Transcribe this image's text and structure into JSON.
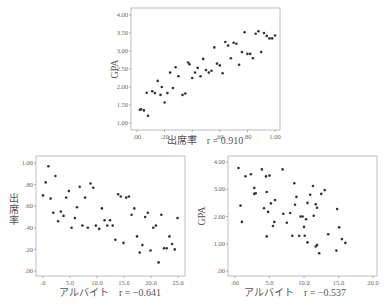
{
  "chart_data": [
    {
      "id": "top",
      "type": "scatter",
      "title": "",
      "xlabel": "出席率",
      "ylabel": "GPA",
      "annotation": "r = 0.910",
      "xlim": [
        0,
        1.0
      ],
      "ylim": [
        1.0,
        4.0
      ],
      "xticks": [
        ".00",
        ".20",
        ".40",
        ".60",
        ".80",
        "1.00"
      ],
      "yticks": [
        "1.00",
        "1.50",
        "2.00",
        "2.50",
        "3.00",
        "3.50",
        "4.00"
      ],
      "grid": false,
      "points": [
        [
          0.02,
          1.37
        ],
        [
          0.03,
          1.38
        ],
        [
          0.05,
          1.35
        ],
        [
          0.07,
          1.84
        ],
        [
          0.08,
          1.2
        ],
        [
          0.11,
          1.88
        ],
        [
          0.13,
          1.83
        ],
        [
          0.15,
          2.17
        ],
        [
          0.17,
          1.78
        ],
        [
          0.18,
          2.0
        ],
        [
          0.2,
          1.57
        ],
        [
          0.22,
          1.83
        ],
        [
          0.24,
          2.4
        ],
        [
          0.26,
          1.97
        ],
        [
          0.28,
          2.55
        ],
        [
          0.3,
          2.3
        ],
        [
          0.33,
          1.78
        ],
        [
          0.35,
          1.82
        ],
        [
          0.37,
          2.68
        ],
        [
          0.38,
          2.63
        ],
        [
          0.4,
          2.25
        ],
        [
          0.42,
          2.4
        ],
        [
          0.44,
          2.53
        ],
        [
          0.46,
          2.3
        ],
        [
          0.48,
          2.78
        ],
        [
          0.5,
          2.47
        ],
        [
          0.52,
          2.4
        ],
        [
          0.54,
          2.45
        ],
        [
          0.56,
          3.1
        ],
        [
          0.58,
          2.65
        ],
        [
          0.6,
          2.6
        ],
        [
          0.62,
          2.38
        ],
        [
          0.64,
          3.25
        ],
        [
          0.66,
          3.15
        ],
        [
          0.68,
          2.8
        ],
        [
          0.7,
          3.23
        ],
        [
          0.72,
          3.2
        ],
        [
          0.74,
          2.62
        ],
        [
          0.76,
          2.97
        ],
        [
          0.78,
          3.52
        ],
        [
          0.8,
          2.92
        ],
        [
          0.82,
          2.92
        ],
        [
          0.84,
          2.8
        ],
        [
          0.86,
          3.48
        ],
        [
          0.88,
          3.55
        ],
        [
          0.9,
          2.97
        ],
        [
          0.92,
          3.5
        ],
        [
          0.94,
          3.42
        ],
        [
          0.96,
          3.35
        ],
        [
          0.98,
          3.35
        ],
        [
          1.0,
          3.43
        ]
      ]
    },
    {
      "id": "bottom_left",
      "type": "scatter",
      "title": "",
      "xlabel": "アルバイト",
      "ylabel": "出席率",
      "annotation": "r = −0.641",
      "xlim": [
        0,
        25.0
      ],
      "ylim": [
        0,
        1.0
      ],
      "xticks": [
        ".0",
        "5.0",
        "10.0",
        "15.0",
        "20.0",
        "25.0"
      ],
      "yticks": [
        ".00",
        ".20",
        ".40",
        ".60",
        ".80",
        "1.00"
      ],
      "grid": false,
      "points": [
        [
          0.0,
          0.7
        ],
        [
          0.5,
          0.82
        ],
        [
          1.0,
          0.97
        ],
        [
          1.4,
          0.67
        ],
        [
          1.9,
          0.54
        ],
        [
          2.3,
          0.88
        ],
        [
          2.8,
          0.46
        ],
        [
          3.3,
          0.55
        ],
        [
          3.8,
          0.51
        ],
        [
          4.3,
          0.68
        ],
        [
          4.8,
          0.74
        ],
        [
          5.3,
          0.4
        ],
        [
          5.9,
          0.49
        ],
        [
          6.3,
          0.59
        ],
        [
          6.8,
          0.78
        ],
        [
          7.3,
          0.42
        ],
        [
          7.8,
          0.68
        ],
        [
          8.3,
          0.4
        ],
        [
          8.8,
          0.81
        ],
        [
          9.3,
          0.77
        ],
        [
          9.8,
          0.42
        ],
        [
          10.4,
          0.39
        ],
        [
          10.9,
          0.58
        ],
        [
          11.4,
          0.47
        ],
        [
          11.9,
          0.42
        ],
        [
          12.4,
          0.47
        ],
        [
          12.9,
          0.42
        ],
        [
          13.4,
          0.29
        ],
        [
          13.9,
          0.71
        ],
        [
          14.4,
          0.69
        ],
        [
          14.9,
          0.26
        ],
        [
          15.4,
          0.68
        ],
        [
          15.9,
          0.69
        ],
        [
          16.4,
          0.52
        ],
        [
          16.9,
          0.58
        ],
        [
          17.4,
          0.32
        ],
        [
          17.9,
          0.17
        ],
        [
          18.4,
          0.24
        ],
        [
          18.9,
          0.5
        ],
        [
          19.4,
          0.54
        ],
        [
          19.9,
          0.19
        ],
        [
          20.4,
          0.4
        ],
        [
          20.9,
          0.42
        ],
        [
          21.4,
          0.08
        ],
        [
          21.9,
          0.52
        ],
        [
          22.4,
          0.21
        ],
        [
          22.9,
          0.21
        ],
        [
          23.4,
          0.32
        ],
        [
          23.9,
          0.25
        ],
        [
          24.4,
          0.2
        ],
        [
          24.9,
          0.49
        ]
      ]
    },
    {
      "id": "bottom_right",
      "type": "scatter",
      "title": "",
      "xlabel": "アルバイト",
      "ylabel": "GPA",
      "annotation": "r = −0.537",
      "xlim": [
        0,
        20.0
      ],
      "ylim": [
        0,
        4.0
      ],
      "xticks": [
        ".00",
        "5.0",
        "10.0",
        "15.0",
        "20.0"
      ],
      "yticks": [
        ".00",
        "1.00",
        "2.00",
        "3.00",
        "4.00"
      ],
      "grid": false,
      "points": [
        [
          0.5,
          3.78
        ],
        [
          0.8,
          2.4
        ],
        [
          1.0,
          1.8
        ],
        [
          1.5,
          3.48
        ],
        [
          2.3,
          3.55
        ],
        [
          2.8,
          3.05
        ],
        [
          2.8,
          2.83
        ],
        [
          3.0,
          2.85
        ],
        [
          3.9,
          3.73
        ],
        [
          4.2,
          2.3
        ],
        [
          4.5,
          3.47
        ],
        [
          4.6,
          2.9
        ],
        [
          4.6,
          1.27
        ],
        [
          4.8,
          2.17
        ],
        [
          5.0,
          3.5
        ],
        [
          5.2,
          2.48
        ],
        [
          5.5,
          1.65
        ],
        [
          5.7,
          1.8
        ],
        [
          5.8,
          2.6
        ],
        [
          6.9,
          3.73
        ],
        [
          7.0,
          2.1
        ],
        [
          7.5,
          1.77
        ],
        [
          8.0,
          2.13
        ],
        [
          8.3,
          1.29
        ],
        [
          8.6,
          3.22
        ],
        [
          8.7,
          2.43
        ],
        [
          8.9,
          2.72
        ],
        [
          9.3,
          1.29
        ],
        [
          9.5,
          2.0
        ],
        [
          9.8,
          2.0
        ],
        [
          10.0,
          1.62
        ],
        [
          10.1,
          1.29
        ],
        [
          10.3,
          1.9
        ],
        [
          10.5,
          2.5
        ],
        [
          10.5,
          1.05
        ],
        [
          10.9,
          2.8
        ],
        [
          11.3,
          3.12
        ],
        [
          11.4,
          2.03
        ],
        [
          11.7,
          2.45
        ],
        [
          11.9,
          2.32
        ],
        [
          11.7,
          0.9
        ],
        [
          11.9,
          0.95
        ],
        [
          12.2,
          0.65
        ],
        [
          12.5,
          2.83
        ],
        [
          13.0,
          2.97
        ],
        [
          13.5,
          1.35
        ],
        [
          14.7,
          0.75
        ],
        [
          14.8,
          2.27
        ],
        [
          15.1,
          1.6
        ],
        [
          15.5,
          1.17
        ],
        [
          16.0,
          1.03
        ]
      ]
    }
  ],
  "caption_partial": ""
}
